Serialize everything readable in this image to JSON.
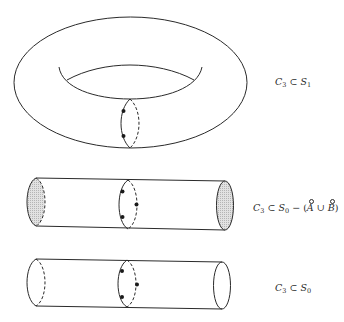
{
  "figure": {
    "stroke_color": "#2a2a2a",
    "fill_color": "#d8d8d8",
    "panels": [
      {
        "shape": "torus",
        "label": {
          "c": "C",
          "c_sub": "3",
          "subset": "⊂",
          "s": "S",
          "s_sub": "1"
        },
        "curve_points": 2
      },
      {
        "shape": "cylinder",
        "ends_shaded": true,
        "label": {
          "c": "C",
          "c_sub": "3",
          "subset": "⊂",
          "s": "S",
          "s_sub": "0",
          "minus": "−",
          "lparen": "(",
          "a": "A",
          "cup": "∪",
          "b": "B",
          "rparen": ")"
        },
        "curve_points": 3
      },
      {
        "shape": "cylinder",
        "ends_shaded": false,
        "label": {
          "c": "C",
          "c_sub": "3",
          "subset": "⊂",
          "s": "S",
          "s_sub": "0"
        },
        "curve_points": 3
      }
    ]
  }
}
